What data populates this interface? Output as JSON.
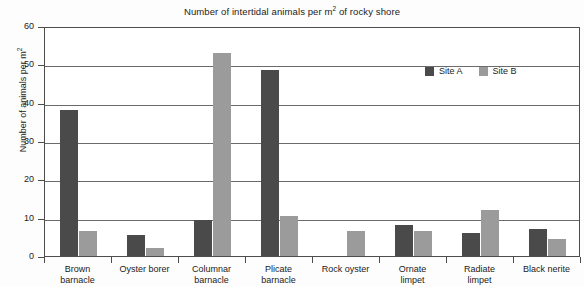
{
  "chart_data": {
    "type": "bar",
    "title_main": "Number of intertidal animals per m",
    "title_sup": "2",
    "title_tail": " of rocky shore",
    "xlabel": "",
    "ylabel": "Number of animals  per m²",
    "ylabel_main": "Number of animals  per m",
    "ylabel_sup": "2",
    "ylim": [
      0,
      60
    ],
    "ytick_values": [
      0,
      10,
      20,
      30,
      40,
      50,
      60
    ],
    "ytick_labels": [
      "0",
      "10",
      "20",
      "30",
      "40",
      "50",
      "60"
    ],
    "grid": true,
    "grid_axis": "y",
    "legend_position": "upper right inside",
    "categories": [
      "Brown barnacle",
      "Oyster borer",
      "Columnar barnacle",
      "Plicate barnacle",
      "Rock oyster",
      "Ornate limpet",
      "Radiate limpet",
      "Black nerite"
    ],
    "category_lines": [
      [
        "Brown",
        "barnacle"
      ],
      [
        "Oyster borer"
      ],
      [
        "Columnar",
        "barnacle"
      ],
      [
        "Plicate",
        "barnacle"
      ],
      [
        "Rock oyster"
      ],
      [
        "Ornate",
        "limpet"
      ],
      [
        "Radiate",
        "limpet"
      ],
      [
        "Black nerite"
      ]
    ],
    "series": [
      {
        "name": "Site A",
        "color": "#4a4a4a",
        "values": [
          38,
          5.5,
          9.5,
          48.5,
          0,
          8,
          6,
          7
        ]
      },
      {
        "name": "Site B",
        "color": "#9b9b9b",
        "values": [
          6.5,
          2,
          53,
          10.5,
          6.5,
          6.5,
          12,
          4.5
        ]
      }
    ]
  },
  "legend": {
    "items": [
      {
        "label": "Site A",
        "color": "#4a4a4a"
      },
      {
        "label": "Site B",
        "color": "#9b9b9b"
      }
    ]
  }
}
